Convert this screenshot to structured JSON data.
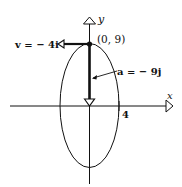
{
  "diagram": {
    "type": "elliptical-orbit-kinematics",
    "colors": {
      "ink": "#111111",
      "background": "#ffffff"
    },
    "axes": {
      "x_label": "x",
      "y_label": "y",
      "x_tick_label": "4"
    },
    "point": {
      "label": "(0, 9)"
    },
    "velocity": {
      "label": "v = − 4i"
    },
    "acceleration": {
      "label": "a = − 9j"
    }
  }
}
